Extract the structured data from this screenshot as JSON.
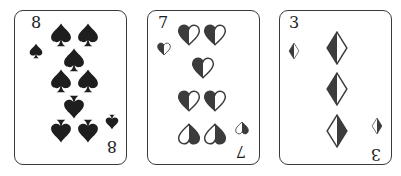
{
  "cards": [
    {
      "rank": "8",
      "suit": "spades",
      "icon": "spade-icon",
      "left": 14,
      "corner_top": {
        "rank": [
          21,
          12
        ],
        "pip": [
          21,
          40
        ]
      },
      "corner_bottom": {
        "rank": [
          97,
          135
        ],
        "pip": [
          97,
          111
        ]
      },
      "pips": [
        {
          "x": 46,
          "y": 24,
          "inverted": false
        },
        {
          "x": 73,
          "y": 24,
          "inverted": false
        },
        {
          "x": 59,
          "y": 49,
          "inverted": false
        },
        {
          "x": 46,
          "y": 70,
          "inverted": false
        },
        {
          "x": 73,
          "y": 70,
          "inverted": false
        },
        {
          "x": 59,
          "y": 96,
          "inverted": true
        },
        {
          "x": 46,
          "y": 120,
          "inverted": true
        },
        {
          "x": 73,
          "y": 120,
          "inverted": true
        }
      ]
    },
    {
      "rank": "7",
      "suit": "hearts",
      "icon": "heart-icon",
      "left": 147,
      "corner_top": {
        "rank": [
          15,
          12
        ],
        "pip": [
          16,
          38
        ]
      },
      "corner_bottom": {
        "rank": [
          93,
          140
        ],
        "pip": [
          94,
          117
        ]
      },
      "pips": [
        {
          "x": 41,
          "y": 24,
          "inverted": false
        },
        {
          "x": 67,
          "y": 24,
          "inverted": false
        },
        {
          "x": 55,
          "y": 57,
          "inverted": false
        },
        {
          "x": 41,
          "y": 90,
          "inverted": false
        },
        {
          "x": 67,
          "y": 90,
          "inverted": false
        },
        {
          "x": 41,
          "y": 123,
          "inverted": true
        },
        {
          "x": 67,
          "y": 123,
          "inverted": true
        }
      ]
    },
    {
      "rank": "3",
      "suit": "diamonds",
      "icon": "diamond-icon",
      "left": 279,
      "corner_top": {
        "rank": [
          14,
          12
        ],
        "pip": [
          14,
          40
        ]
      },
      "corner_bottom": {
        "rank": [
          96,
          143
        ],
        "pip": [
          97,
          115
        ]
      },
      "pips": [
        {
          "x": 57,
          "y": 37,
          "inverted": false
        },
        {
          "x": 57,
          "y": 78,
          "inverted": false
        },
        {
          "x": 57,
          "y": 120,
          "inverted": true
        }
      ]
    }
  ],
  "colors": {
    "border": "#3a3a3a",
    "ink": "#1e1e1e",
    "half_fill": "#3c3c3c",
    "background": "#ffffff"
  }
}
